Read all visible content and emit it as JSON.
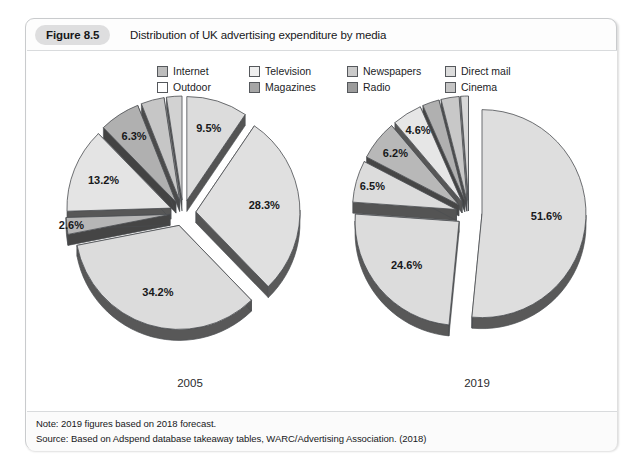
{
  "figure": {
    "number_label": "Figure 8.5",
    "title": "Distribution of UK advertising expenditure by media"
  },
  "legend": {
    "row1": [
      {
        "label": "Internet",
        "color": "#bdbdbd"
      },
      {
        "label": "Television",
        "color": "#efefef"
      },
      {
        "label": "Newspapers",
        "color": "#cacaca"
      },
      {
        "label": "Direct mail",
        "color": "#dcdcdc"
      }
    ],
    "row2": [
      {
        "label": "Outdoor",
        "color": "#ffffff"
      },
      {
        "label": "Magazines",
        "color": "#a6a6a6"
      },
      {
        "label": "Radio",
        "color": "#9c9c9c"
      },
      {
        "label": "Cinema",
        "color": "#c4c4c4"
      }
    ]
  },
  "notes": {
    "note": "Note: 2019 figures based on 2018 forecast.",
    "source": "Source: Based on Adspend database takeaway tables, WARC/Advertising Association. (2018)"
  },
  "axis_years": {
    "left": "2005",
    "right": "2019"
  },
  "chart_data": {
    "type": "pie",
    "title": "Distribution of UK advertising expenditure by media",
    "note": "Note: 2019 figures based on 2018 forecast.",
    "source": "Source: Based on Adspend database takeaway tables, WARC/Advertising Association. (2018)",
    "legend_position": "top-center",
    "categories": [
      "Internet",
      "Television",
      "Newspapers",
      "Direct mail",
      "Outdoor",
      "Magazines",
      "Radio",
      "Cinema"
    ],
    "colors": [
      "#bdbdbd",
      "#efefef",
      "#cacaca",
      "#dcdcdc",
      "#ffffff",
      "#a6a6a6",
      "#9c9c9c",
      "#c4c4c4"
    ],
    "charts": [
      {
        "name": "2005",
        "label": "2005",
        "exploded": true,
        "slices": [
          {
            "category": "Internet",
            "value": 9.5,
            "label": "9.5%",
            "color": "#dcdcdc"
          },
          {
            "category": "Television",
            "value": 28.3,
            "label": "28.3%",
            "color": "#e0e0e0"
          },
          {
            "category": "Newspapers",
            "value": 34.2,
            "label": "34.2%",
            "color": "#dcdcdc"
          },
          {
            "category": "Direct mail",
            "value": 2.6,
            "label": "2.6%",
            "color": "#b6b6b6"
          },
          {
            "category": "Outdoor",
            "value": 13.2,
            "label": "13.2%",
            "color": "#e4e4e4"
          },
          {
            "category": "Magazines",
            "value": 6.3,
            "label": "6.3%",
            "color": "#b0b0b0"
          },
          {
            "category": "Radio",
            "value": 3.6,
            "label": "3.6%",
            "color": "#c6c6c6"
          },
          {
            "category": "Cinema",
            "value": 2.4,
            "label": "2.4%",
            "color": "#d2d2d2"
          }
        ]
      },
      {
        "name": "2019",
        "label": "2019",
        "exploded": true,
        "slices": [
          {
            "category": "Internet",
            "value": 51.6,
            "label": "51.6%",
            "color": "#dedede"
          },
          {
            "category": "Television",
            "value": 24.6,
            "label": "24.6%",
            "color": "#dcdcdc"
          },
          {
            "category": "Newspapers",
            "value": 6.5,
            "label": "6.5%",
            "color": "#dcdcdc"
          },
          {
            "category": "Direct mail",
            "value": 6.2,
            "label": "6.2%",
            "color": "#b8b8b8"
          },
          {
            "category": "Outdoor",
            "value": 4.6,
            "label": "4.6%",
            "color": "#e6e6e6"
          },
          {
            "category": "Magazines",
            "value": 2.6,
            "label": "2.6%",
            "color": "#b0b0b0"
          },
          {
            "category": "Radio",
            "value": 2.8,
            "label": "2.8%",
            "color": "#c8c8c8"
          },
          {
            "category": "Cinema",
            "value": 1.2,
            "label": "1.2%",
            "color": "#d8d8d8"
          }
        ]
      }
    ]
  }
}
